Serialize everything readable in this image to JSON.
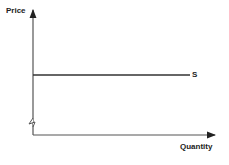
{
  "diagram": {
    "y_axis_label": "Price",
    "x_axis_label": "Quantity",
    "curve_label": "S",
    "colors": {
      "line": "#333333",
      "text": "#222222",
      "background": "#ffffff"
    }
  }
}
